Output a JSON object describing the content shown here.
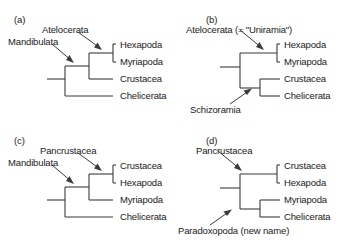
{
  "figure": {
    "panels": [
      {
        "id": "a",
        "panel_label": "(a)",
        "taxa": [
          "Hexapoda",
          "Myriapoda",
          "Crustacea",
          "Chelicerata"
        ],
        "clade_labels": [
          "Atelocerata",
          "Mandibulata"
        ],
        "topology": "((Hexapoda,Myriapoda),Crustacea),Chelicerata"
      },
      {
        "id": "b",
        "panel_label": "(b)",
        "taxa": [
          "Hexapoda",
          "Myriapoda",
          "Crustacea",
          "Chelicerata"
        ],
        "clade_labels": [
          "Atelocerata (= \"Uniramia\")",
          "Schizoramia"
        ],
        "topology": "(Hexapoda,Myriapoda),(Crustacea,Chelicerata)"
      },
      {
        "id": "c",
        "panel_label": "(c)",
        "taxa": [
          "Crustacea",
          "Hexapoda",
          "Myriapoda",
          "Chelicerata"
        ],
        "clade_labels": [
          "Pancrustacea",
          "Mandibulata"
        ],
        "topology": "((Crustacea,Hexapoda),Myriapoda),Chelicerata"
      },
      {
        "id": "d",
        "panel_label": "(d)",
        "taxa": [
          "Crustacea",
          "Hexapoda",
          "Myriapoda",
          "Chelicerata"
        ],
        "clade_labels": [
          "Pancrustacea",
          "Paradoxopoda (new name)"
        ],
        "topology": "(Crustacea,Hexapoda),(Myriapoda,Chelicerata)"
      }
    ],
    "colors": {
      "line": "#3b3b3b",
      "text": "#1a1a1a",
      "background": "#ffffff"
    }
  }
}
